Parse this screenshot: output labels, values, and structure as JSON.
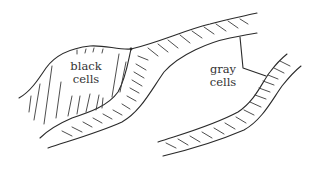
{
  "diagram": {
    "type": "hand-drawn schematic",
    "labels": {
      "black_cells": {
        "line1": "black",
        "line2": "cells"
      },
      "gray_cells": {
        "line1": "gray",
        "line2": "cells"
      }
    },
    "colors": {
      "ink": "#2a2a2a",
      "background": "#ffffff"
    }
  }
}
